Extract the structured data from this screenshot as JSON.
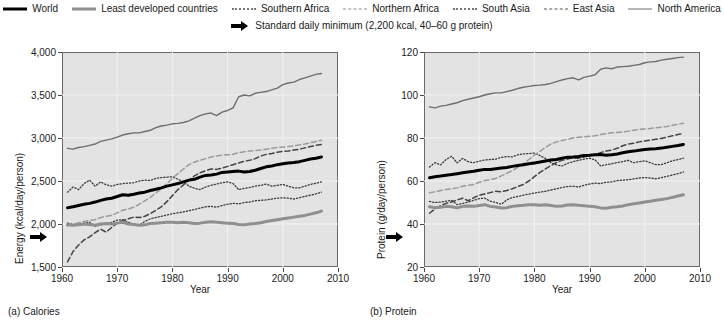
{
  "legend": {
    "items": [
      {
        "label": "World",
        "style": "solid-black"
      },
      {
        "label": "Least developed countries",
        "style": "solid-gray"
      },
      {
        "label": "Southern Africa",
        "style": "dotted"
      },
      {
        "label": "Northern Africa",
        "style": "dashed"
      },
      {
        "label": "South Asia",
        "style": "dotted"
      },
      {
        "label": "East Asia",
        "style": "dashed-dk"
      },
      {
        "label": "North America",
        "style": "solid-thin"
      }
    ],
    "annotation": {
      "icon": "right-arrow-icon",
      "text": "Standard daily minimum (2,200 kcal, 40–60 g protein)"
    }
  },
  "panels": [
    {
      "caption": "(a) Calories",
      "chart_index": 0
    },
    {
      "caption": "(b) Protein",
      "chart_index": 1
    }
  ],
  "chart_data": [
    {
      "type": "line",
      "title": "(a) Calories",
      "xlabel": "Year",
      "ylabel": "Energy (kcal/day/person)",
      "xlim": [
        1960,
        2010
      ],
      "ylim": [
        1500,
        4000
      ],
      "xticks": [
        1960,
        1970,
        1980,
        1990,
        2000,
        2010
      ],
      "xticklabels": [
        "1960",
        "1970",
        "1980",
        "1990",
        "2000",
        "2010"
      ],
      "yticks": [
        1500,
        2000,
        2500,
        3000,
        3500,
        4000
      ],
      "yticklabels": [
        "1,500",
        "2,000",
        "2,500",
        "3,000",
        "3,500",
        "4,000"
      ],
      "grid": true,
      "legend_position": "above-figure",
      "reference_line": {
        "label": "Standard daily minimum",
        "value": 2200,
        "marker": "axis-arrow"
      },
      "x": [
        1961,
        1962,
        1963,
        1964,
        1965,
        1966,
        1967,
        1968,
        1969,
        1970,
        1971,
        1972,
        1973,
        1974,
        1975,
        1976,
        1977,
        1978,
        1979,
        1980,
        1981,
        1982,
        1983,
        1984,
        1985,
        1986,
        1987,
        1988,
        1989,
        1990,
        1991,
        1992,
        1993,
        1994,
        1995,
        1996,
        1997,
        1998,
        1999,
        2000,
        2001,
        2002,
        2003,
        2004,
        2005,
        2006,
        2007
      ],
      "series": [
        {
          "name": "World",
          "style": "solid-black",
          "values": [
            2190,
            2200,
            2215,
            2230,
            2240,
            2255,
            2275,
            2290,
            2300,
            2320,
            2340,
            2335,
            2345,
            2360,
            2370,
            2390,
            2405,
            2420,
            2440,
            2455,
            2470,
            2490,
            2510,
            2520,
            2545,
            2565,
            2570,
            2580,
            2600,
            2605,
            2610,
            2615,
            2605,
            2610,
            2625,
            2645,
            2665,
            2675,
            2690,
            2700,
            2710,
            2715,
            2725,
            2740,
            2755,
            2765,
            2780
          ]
        },
        {
          "name": "Least developed countries",
          "style": "solid-gray",
          "values": [
            1990,
            1985,
            1990,
            2000,
            1995,
            1985,
            2000,
            2005,
            2000,
            2010,
            2020,
            2000,
            1995,
            1985,
            1990,
            2005,
            2010,
            2015,
            2020,
            2020,
            2015,
            2020,
            2015,
            2005,
            2010,
            2020,
            2025,
            2020,
            2015,
            2010,
            2005,
            1995,
            1990,
            2000,
            2005,
            2015,
            2030,
            2040,
            2050,
            2060,
            2070,
            2080,
            2090,
            2100,
            2115,
            2130,
            2150
          ]
        },
        {
          "name": "Southern Africa",
          "style": "dotted",
          "values": [
            2370,
            2430,
            2400,
            2470,
            2510,
            2440,
            2490,
            2455,
            2440,
            2460,
            2470,
            2475,
            2480,
            2500,
            2510,
            2505,
            2530,
            2540,
            2545,
            2550,
            2520,
            2490,
            2440,
            2415,
            2400,
            2430,
            2450,
            2465,
            2480,
            2490,
            2470,
            2400,
            2415,
            2425,
            2440,
            2450,
            2465,
            2440,
            2450,
            2460,
            2440,
            2420,
            2420,
            2440,
            2460,
            2475,
            2490
          ]
        },
        {
          "name": "Northern Africa",
          "style": "dashed",
          "values": [
            1980,
            1995,
            2015,
            2030,
            2040,
            2050,
            2075,
            2090,
            2100,
            2130,
            2160,
            2175,
            2195,
            2230,
            2270,
            2310,
            2360,
            2410,
            2470,
            2530,
            2585,
            2640,
            2690,
            2720,
            2740,
            2760,
            2780,
            2790,
            2800,
            2805,
            2810,
            2830,
            2840,
            2850,
            2855,
            2860,
            2870,
            2880,
            2890,
            2895,
            2900,
            2910,
            2920,
            2930,
            2945,
            2960,
            2975
          ]
        },
        {
          "name": "South Asia",
          "style": "dotted",
          "values": [
            2010,
            1995,
            2000,
            2010,
            2020,
            1975,
            1990,
            2005,
            2020,
            2045,
            2050,
            2020,
            2000,
            1985,
            2030,
            2060,
            2075,
            2090,
            2105,
            2120,
            2130,
            2140,
            2155,
            2170,
            2185,
            2200,
            2205,
            2195,
            2215,
            2230,
            2240,
            2235,
            2250,
            2255,
            2270,
            2275,
            2280,
            2290,
            2300,
            2305,
            2300,
            2290,
            2305,
            2320,
            2335,
            2350,
            2370
          ]
        },
        {
          "name": "East Asia",
          "style": "dashed-dk",
          "values": [
            1560,
            1680,
            1755,
            1815,
            1850,
            1900,
            1940,
            1905,
            1960,
            2010,
            2040,
            2060,
            2080,
            2075,
            2090,
            2120,
            2160,
            2200,
            2260,
            2330,
            2400,
            2455,
            2510,
            2560,
            2595,
            2620,
            2640,
            2635,
            2650,
            2670,
            2690,
            2710,
            2730,
            2740,
            2760,
            2790,
            2810,
            2820,
            2835,
            2845,
            2850,
            2860,
            2870,
            2885,
            2900,
            2915,
            2925
          ]
        },
        {
          "name": "North America",
          "style": "solid-thin",
          "values": [
            2880,
            2870,
            2890,
            2900,
            2915,
            2930,
            2960,
            2975,
            2990,
            3010,
            3035,
            3050,
            3060,
            3060,
            3075,
            3090,
            3120,
            3140,
            3150,
            3165,
            3170,
            3180,
            3200,
            3230,
            3260,
            3280,
            3290,
            3260,
            3300,
            3320,
            3350,
            3480,
            3500,
            3490,
            3520,
            3530,
            3540,
            3560,
            3580,
            3620,
            3640,
            3650,
            3680,
            3700,
            3720,
            3740,
            3750
          ]
        }
      ]
    },
    {
      "type": "line",
      "title": "(b) Protein",
      "xlabel": "Year",
      "ylabel": "Protein (g/day/person)",
      "xlim": [
        1960,
        2010
      ],
      "ylim": [
        20,
        120
      ],
      "xticks": [
        1960,
        1970,
        1980,
        1990,
        2000,
        2010
      ],
      "xticklabels": [
        "1960",
        "1970",
        "1980",
        "1990",
        "2000",
        "2010"
      ],
      "yticks": [
        20,
        40,
        60,
        80,
        100,
        120
      ],
      "yticklabels": [
        "20",
        "40",
        "60",
        "80",
        "100",
        "120"
      ],
      "grid": true,
      "legend_position": "above-figure",
      "reference_line": {
        "label": "Standard daily minimum",
        "value": 47,
        "marker": "axis-arrow"
      },
      "x": [
        1961,
        1962,
        1963,
        1964,
        1965,
        1966,
        1967,
        1968,
        1969,
        1970,
        1971,
        1972,
        1973,
        1974,
        1975,
        1976,
        1977,
        1978,
        1979,
        1980,
        1981,
        1982,
        1983,
        1984,
        1985,
        1986,
        1987,
        1988,
        1989,
        1990,
        1991,
        1992,
        1993,
        1994,
        1995,
        1996,
        1997,
        1998,
        1999,
        2000,
        2001,
        2002,
        2003,
        2004,
        2005,
        2006,
        2007
      ],
      "series": [
        {
          "name": "World",
          "style": "solid-black",
          "values": [
            61.5,
            62.0,
            62.3,
            62.7,
            63.0,
            63.4,
            63.8,
            64.2,
            64.5,
            65.0,
            65.4,
            65.4,
            65.7,
            66.0,
            66.3,
            66.8,
            67.2,
            67.6,
            68.0,
            68.4,
            68.8,
            69.3,
            69.8,
            70.0,
            70.6,
            71.1,
            71.2,
            71.4,
            71.9,
            72.0,
            72.2,
            72.3,
            72.0,
            72.2,
            72.6,
            73.1,
            73.6,
            73.9,
            74.3,
            74.6,
            74.9,
            75.0,
            75.3,
            75.7,
            76.1,
            76.5,
            77.0
          ]
        },
        {
          "name": "Least developed countries",
          "style": "solid-gray",
          "values": [
            48.0,
            47.6,
            47.8,
            48.2,
            48.0,
            47.5,
            48.2,
            48.4,
            48.2,
            48.6,
            49.0,
            48.2,
            47.9,
            47.4,
            47.6,
            48.2,
            48.5,
            48.7,
            49.0,
            49.0,
            48.7,
            49.0,
            48.6,
            48.2,
            48.4,
            48.8,
            49.0,
            48.7,
            48.5,
            48.2,
            48.0,
            47.5,
            47.3,
            47.8,
            48.0,
            48.4,
            49.0,
            49.4,
            49.8,
            50.2,
            50.6,
            51.0,
            51.4,
            51.8,
            52.4,
            53.0,
            53.6
          ]
        },
        {
          "name": "Southern Africa",
          "style": "dotted",
          "values": [
            66.5,
            68.5,
            67.5,
            70.0,
            71.5,
            68.5,
            70.5,
            69.0,
            68.5,
            69.2,
            69.8,
            70.0,
            70.2,
            71.0,
            71.4,
            71.2,
            72.2,
            72.6,
            72.8,
            73.0,
            71.8,
            70.5,
            68.5,
            67.5,
            67.0,
            68.2,
            69.0,
            69.6,
            70.2,
            70.6,
            69.8,
            67.0,
            67.6,
            68.0,
            68.6,
            69.0,
            69.6,
            68.5,
            69.0,
            69.4,
            68.5,
            67.6,
            67.6,
            68.5,
            69.4,
            70.0,
            70.6
          ]
        },
        {
          "name": "South Asia",
          "style": "dotted",
          "values": [
            50.5,
            50.0,
            50.2,
            50.6,
            51.0,
            49.0,
            49.6,
            50.2,
            51.0,
            51.8,
            52.0,
            50.6,
            50.0,
            49.2,
            51.2,
            52.3,
            52.8,
            53.4,
            53.9,
            54.4,
            54.8,
            55.2,
            55.8,
            56.4,
            57.0,
            57.4,
            57.6,
            57.2,
            58.0,
            58.6,
            59.0,
            58.8,
            59.4,
            59.6,
            60.2,
            60.4,
            60.6,
            61.0,
            61.4,
            61.6,
            61.4,
            61.0,
            61.6,
            62.2,
            62.8,
            63.4,
            64.2
          ]
        },
        {
          "name": "Northern Africa",
          "style": "dashed",
          "values": [
            54.5,
            55.0,
            55.6,
            56.0,
            56.4,
            56.8,
            57.6,
            58.0,
            58.4,
            59.4,
            60.2,
            60.6,
            61.2,
            62.4,
            63.6,
            64.8,
            66.4,
            68.0,
            70.0,
            72.0,
            73.8,
            75.6,
            77.2,
            78.2,
            78.8,
            79.4,
            80.0,
            80.4,
            80.6,
            80.8,
            81.0,
            81.6,
            82.0,
            82.4,
            82.6,
            82.8,
            83.2,
            83.6,
            84.0,
            84.2,
            84.4,
            84.8,
            85.0,
            85.4,
            85.9,
            86.4,
            86.9
          ]
        },
        {
          "name": "East Asia",
          "style": "dashed-dk",
          "values": [
            45.0,
            47.0,
            48.5,
            49.6,
            50.2,
            51.2,
            52.0,
            50.8,
            52.2,
            53.4,
            54.0,
            54.6,
            55.2,
            55.0,
            55.6,
            56.4,
            57.4,
            58.4,
            60.0,
            62.0,
            64.0,
            65.6,
            67.2,
            68.6,
            69.6,
            70.2,
            70.8,
            70.6,
            71.2,
            71.8,
            72.4,
            73.2,
            74.0,
            74.4,
            75.2,
            76.4,
            77.2,
            77.6,
            78.2,
            78.6,
            79.0,
            79.4,
            79.8,
            80.4,
            81.0,
            81.6,
            82.2
          ]
        },
        {
          "name": "North America",
          "style": "solid-thin",
          "values": [
            94.5,
            94.0,
            94.8,
            95.2,
            95.8,
            96.4,
            97.4,
            98.0,
            98.6,
            99.2,
            100.0,
            100.6,
            101.0,
            101.0,
            101.6,
            102.2,
            103.0,
            103.6,
            104.0,
            104.4,
            104.6,
            104.9,
            105.4,
            106.2,
            107.0,
            107.6,
            108.0,
            107.0,
            108.2,
            108.8,
            109.4,
            112.0,
            112.6,
            112.2,
            113.0,
            113.2,
            113.4,
            113.8,
            114.2,
            115.0,
            115.4,
            115.6,
            116.2,
            116.6,
            117.0,
            117.4,
            117.6
          ]
        }
      ]
    }
  ]
}
